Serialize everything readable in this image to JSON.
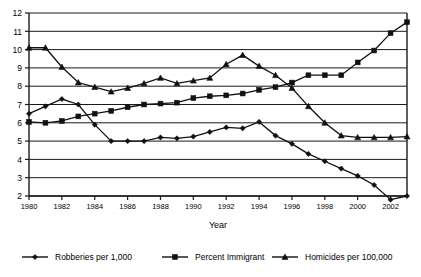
{
  "chart_data": {
    "type": "line",
    "title": "",
    "xlabel": "Year",
    "ylabel": "",
    "xlim": [
      1980,
      2003
    ],
    "ylim": [
      2,
      12
    ],
    "grid": true,
    "legend_position": "bottom",
    "y_ticks": [
      2,
      3,
      4,
      5,
      6,
      7,
      8,
      9,
      10,
      11,
      12
    ],
    "x_ticks": [
      1980,
      1982,
      1984,
      1986,
      1988,
      1990,
      1992,
      1994,
      1996,
      1998,
      2000,
      2002
    ],
    "x": [
      1980,
      1981,
      1982,
      1983,
      1984,
      1985,
      1986,
      1987,
      1988,
      1989,
      1990,
      1991,
      1992,
      1993,
      1994,
      1995,
      1996,
      1997,
      1998,
      1999,
      2000,
      2001,
      2002,
      2003
    ],
    "series": [
      {
        "name": "Robberies per 1,000",
        "marker": "diamond",
        "color": "#111111",
        "values": [
          6.5,
          6.9,
          7.3,
          7.0,
          5.9,
          5.0,
          5.0,
          5.0,
          5.2,
          5.15,
          5.25,
          5.5,
          5.75,
          5.7,
          6.05,
          5.3,
          4.85,
          4.3,
          3.9,
          3.5,
          3.1,
          2.6,
          1.8,
          2.0
        ]
      },
      {
        "name": "Percent Immigrant",
        "marker": "square",
        "color": "#111111",
        "values": [
          6.05,
          6.0,
          6.1,
          6.35,
          6.5,
          6.65,
          6.85,
          7.0,
          7.05,
          7.1,
          7.35,
          7.45,
          7.5,
          7.6,
          7.8,
          7.95,
          8.2,
          8.6,
          8.6,
          8.6,
          9.3,
          9.95,
          10.9,
          11.5
        ]
      },
      {
        "name": "Homicides per 100,000",
        "marker": "triangle",
        "color": "#111111",
        "values": [
          10.1,
          10.1,
          9.05,
          8.2,
          7.95,
          7.7,
          7.9,
          8.15,
          8.45,
          8.15,
          8.3,
          8.45,
          9.2,
          9.7,
          9.1,
          8.6,
          7.9,
          6.9,
          6.0,
          5.3,
          5.2,
          5.2,
          5.2,
          5.25
        ]
      }
    ]
  },
  "legend": {
    "items": [
      {
        "label": "Robberies per 1,000",
        "marker": "diamond"
      },
      {
        "label": "Percent Immigrant",
        "marker": "square"
      },
      {
        "label": "Homicides per 100,000",
        "marker": "triangle"
      }
    ]
  }
}
